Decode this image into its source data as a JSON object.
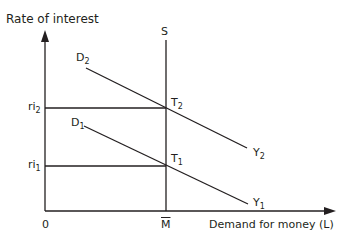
{
  "diagram": {
    "y_axis_label": "Rate of interest",
    "x_axis_label": "Demand for money (L)",
    "origin_label": "0",
    "supply_label": "S",
    "supply_x_label": "M",
    "interest_rates": [
      {
        "base": "ri",
        "sub": "2"
      },
      {
        "base": "ri",
        "sub": "1"
      }
    ],
    "curves": [
      {
        "start_base": "D",
        "start_sub": "2",
        "end_base": "Y",
        "end_sub": "2"
      },
      {
        "start_base": "D",
        "start_sub": "1",
        "end_base": "Y",
        "end_sub": "1"
      }
    ],
    "points": [
      {
        "base": "T",
        "sub": "2"
      },
      {
        "base": "T",
        "sub": "1"
      }
    ],
    "line_color": "#231f20"
  }
}
